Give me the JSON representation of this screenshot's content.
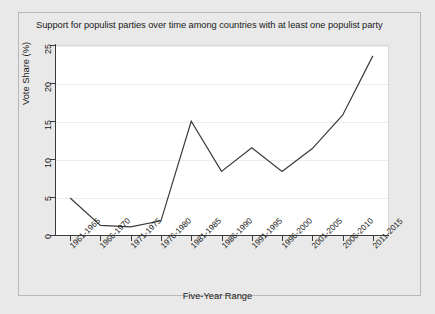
{
  "chart_data": {
    "type": "line",
    "title": "Support for populist parties over time among countries with at least one populist party",
    "xlabel": "Five-Year Range",
    "ylabel": "Vote Share (%)",
    "categories": [
      "1961-1965",
      "1966-1970",
      "1971-1975",
      "1976-1980",
      "1981-1985",
      "1986-1990",
      "1991-1995",
      "1996-2000",
      "2001-2005",
      "2006-2010",
      "2011-2015"
    ],
    "values": [
      5.0,
      1.4,
      1.2,
      2.0,
      15.1,
      8.5,
      11.6,
      8.5,
      11.5,
      15.9,
      23.7
    ],
    "ylim": [
      0,
      25
    ],
    "yticks": [
      0,
      5,
      10,
      15,
      20,
      25
    ],
    "ytick_labels": [
      "0",
      "5",
      "10",
      "15",
      "20",
      "25"
    ],
    "grid": true,
    "legend": "none",
    "series_color": "#3a3a3a",
    "plot_background": "#ffffff",
    "figure_background": "#e9e9e9"
  }
}
